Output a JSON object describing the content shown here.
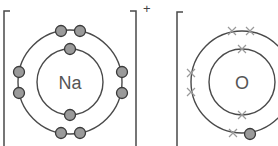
{
  "figure": {
    "type": "dot-and-cross ionic bonding diagram",
    "colors": {
      "shell_line": "#4a4a4a",
      "dot_fill": "#9a9a9a",
      "dot_stroke": "#3a3a3a",
      "cross": "#9a9a9a",
      "symbol_text": "#555555"
    }
  },
  "ions": [
    {
      "symbol": "Na",
      "charge": "+",
      "electron_marker": "dot",
      "shells": [
        {
          "name": "inner",
          "electrons": 2
        },
        {
          "name": "outer",
          "electrons": 8
        }
      ]
    },
    {
      "symbol": "O",
      "charge": "",
      "electron_marker": "cross",
      "shells": [
        {
          "name": "inner",
          "electrons": 2
        },
        {
          "name": "outer",
          "electrons": 7,
          "transferred_dots": 1
        }
      ]
    }
  ]
}
